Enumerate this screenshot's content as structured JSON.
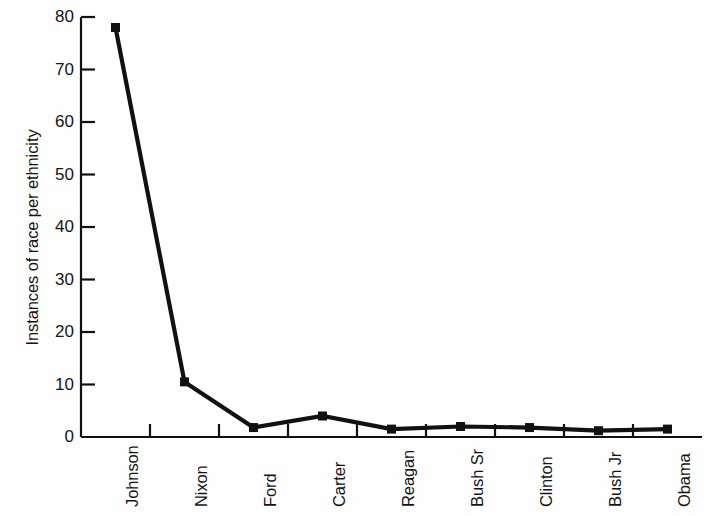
{
  "chart_data": {
    "type": "line",
    "title": "",
    "subtitle": "",
    "xlabel": "",
    "ylabel": "Instances of race per ethnicity",
    "categories": [
      "Johnson",
      "Nixon",
      "Ford",
      "Carter",
      "Reagan",
      "Bush Sr",
      "Clinton",
      "Bush Jr",
      "Obama"
    ],
    "values": [
      78,
      10.5,
      1.8,
      4,
      1.5,
      2,
      1.8,
      1.2,
      1.5
    ],
    "series": [
      {
        "name": "Instances of race per ethnicity",
        "values": [
          78,
          10.5,
          1.8,
          4,
          1.5,
          2,
          1.8,
          1.2,
          1.5
        ]
      }
    ],
    "ylim": [
      0,
      80
    ],
    "yticks": [
      0,
      10,
      20,
      30,
      40,
      50,
      60,
      70,
      80
    ],
    "ytick_labels": [
      "0",
      "10",
      "20",
      "30",
      "40",
      "50",
      "60",
      "70",
      "80"
    ],
    "grid": false,
    "legend": false,
    "legend_position": "none",
    "marker": "square",
    "line_color": "#111111",
    "marker_color": "#111111",
    "background_color": "#fefefe",
    "xtick_rotation": -90
  }
}
